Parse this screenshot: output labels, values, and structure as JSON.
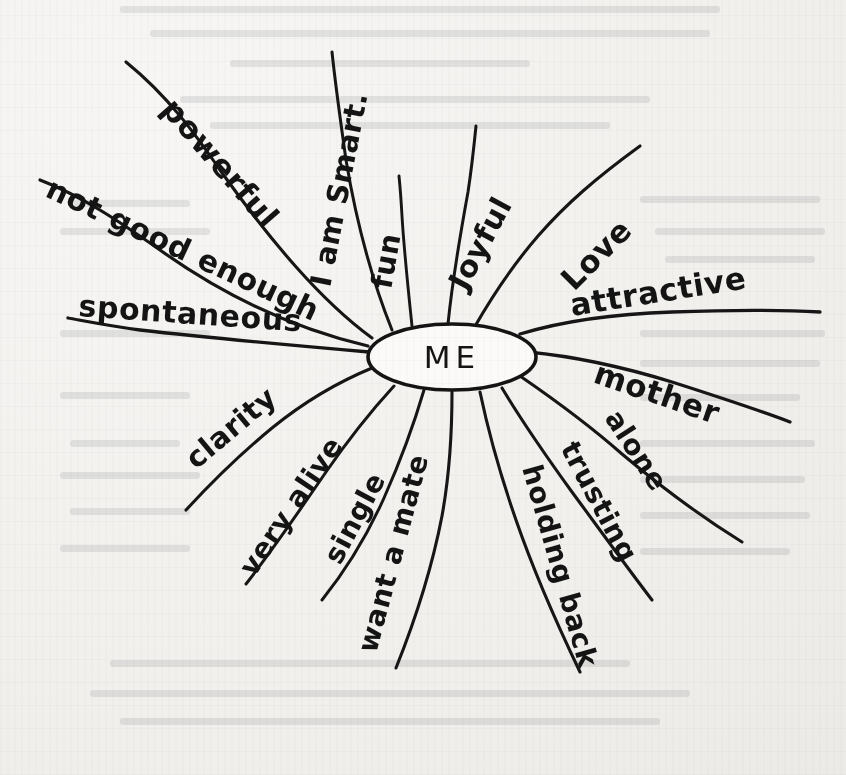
{
  "diagram": {
    "type": "mind-map",
    "medium": "hand-drawn ink on off-white paper",
    "center_label": "ME",
    "branch_count": 16,
    "colors": {
      "ink": "#161616",
      "paper": "#f4f3f1",
      "node_fill": "#fbfaf8"
    },
    "branches": [
      {
        "id": "powerful",
        "label": "powerful",
        "sector": "upper-left"
      },
      {
        "id": "i-am-smart",
        "label": "I am Smart.",
        "sector": "top"
      },
      {
        "id": "fun",
        "label": "fun",
        "sector": "top"
      },
      {
        "id": "joyful",
        "label": "Joyful",
        "sector": "upper-right"
      },
      {
        "id": "love",
        "label": "Love",
        "sector": "upper-right"
      },
      {
        "id": "attractive",
        "label": "attractive",
        "sector": "right"
      },
      {
        "id": "mother",
        "label": "mother",
        "sector": "right"
      },
      {
        "id": "alone",
        "label": "alone",
        "sector": "lower-right"
      },
      {
        "id": "trusting",
        "label": "trusting",
        "sector": "lower-right"
      },
      {
        "id": "holding-back",
        "label": "holding back",
        "sector": "bottom-right"
      },
      {
        "id": "want-a-mate",
        "label": "want a mate",
        "sector": "bottom"
      },
      {
        "id": "single",
        "label": "single",
        "sector": "bottom"
      },
      {
        "id": "very-alive",
        "label": "very alive",
        "sector": "bottom-left"
      },
      {
        "id": "clarity",
        "label": "clarity",
        "sector": "lower-left"
      },
      {
        "id": "spontaneous",
        "label": "spontaneous",
        "sector": "left"
      },
      {
        "id": "not-good-enough",
        "label": "not good enough",
        "sector": "upper-left"
      }
    ]
  }
}
